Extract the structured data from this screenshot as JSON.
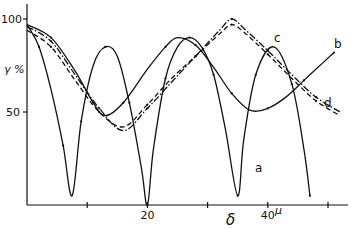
{
  "chart_data": {
    "type": "line",
    "title": "",
    "xlabel": "δ",
    "x_unit": "μ",
    "ylabel": "γ %",
    "xlim": [
      0,
      54
    ],
    "ylim": [
      0,
      105
    ],
    "x_ticks": [
      10,
      20,
      30,
      40,
      50
    ],
    "x_tick_labels": [
      "",
      "20",
      "",
      "40",
      ""
    ],
    "y_ticks": [
      50,
      100
    ],
    "y_tick_labels": [
      "50",
      "100"
    ],
    "grid": false,
    "legend_position": "inline labels at curve ends",
    "series": [
      {
        "name": "a",
        "style": "solid",
        "x": [
          0,
          2,
          4,
          6,
          7.5,
          9,
          11,
          13,
          15,
          17,
          19,
          20,
          21,
          23,
          25,
          27,
          29,
          31,
          33,
          35,
          36,
          38,
          41,
          44,
          46,
          47
        ],
        "y": [
          97,
          85,
          62,
          32,
          5,
          45,
          75,
          85,
          80,
          55,
          20,
          0,
          30,
          68,
          85,
          90,
          85,
          70,
          40,
          5,
          35,
          70,
          85,
          65,
          30,
          5
        ]
      },
      {
        "name": "b",
        "style": "solid",
        "x": [
          0,
          4,
          8,
          11,
          13,
          16,
          20,
          23,
          25,
          28,
          31,
          34,
          37,
          40,
          43,
          46,
          49,
          51
        ],
        "y": [
          97,
          90,
          72,
          55,
          48,
          55,
          73,
          85,
          90,
          86,
          74,
          60,
          51,
          52,
          58,
          67,
          76,
          82
        ]
      },
      {
        "name": "c",
        "style": "dash-dot",
        "x": [
          0,
          4,
          8,
          12,
          16,
          20,
          24,
          28,
          32,
          34,
          36,
          40,
          44,
          48,
          52
        ],
        "y": [
          96,
          88,
          70,
          52,
          40,
          52,
          66,
          80,
          94,
          100,
          95,
          83,
          70,
          58,
          50
        ]
      },
      {
        "name": "d",
        "style": "dashed",
        "x": [
          0,
          4,
          8,
          12,
          16,
          20,
          24,
          28,
          32,
          34,
          36,
          40,
          44,
          48,
          52
        ],
        "y": [
          94,
          85,
          67,
          50,
          42,
          54,
          68,
          80,
          92,
          97,
          93,
          81,
          68,
          56,
          48
        ]
      }
    ],
    "annotations": [
      "a",
      "b",
      "c",
      "d"
    ]
  }
}
